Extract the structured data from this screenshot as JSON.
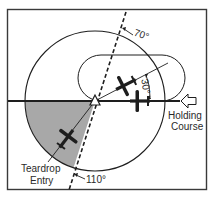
{
  "diagram": {
    "labels": {
      "angle_top": "70°",
      "angle_bottom": "110°",
      "angle_offset": "30°",
      "holding_course_line1": "Holding",
      "holding_course_line2": "Course",
      "entry_line1": "Teardrop",
      "entry_line2": "Entry"
    },
    "colors": {
      "line": "#1e1e1e",
      "sector_fill": "#a8a8a8",
      "background": "#ffffff"
    },
    "icons": {
      "fix": "triangle-fix-icon",
      "arrow": "inbound-arrow-icon",
      "aircraft": "airplane-icon"
    }
  }
}
